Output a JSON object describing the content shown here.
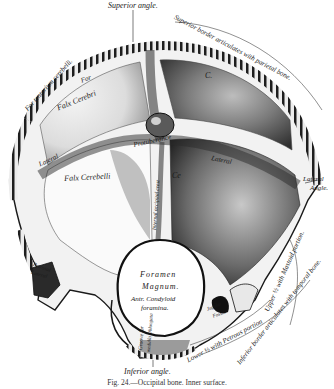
{
  "figure": {
    "caption": "Fig. 24.—Occipital bone. Inner surface.",
    "colors": {
      "ink": "#1a1a1a",
      "shade": "#4a4a4a",
      "mid": "#8a8a8a",
      "light": "#cfcfcf",
      "paper": "#ffffff"
    }
  },
  "labels": {
    "superior_angle": "Superior angle.",
    "superior_border": "Superior border articulates with parietal bone.",
    "for_tentorium": "For tentorium cerebelli.",
    "for": "For",
    "falx_cerebri": "Falx Cerebri",
    "c_upper": "C.",
    "c_left": "C.",
    "lateral_sinus_left": "Lateral",
    "lateral_sinus_right": "Lateral",
    "protuberance": "Protuberance",
    "falx_cerebelli": "Falx Cerebelli",
    "crest": "Internal occipital crest",
    "ce_right": "Ce",
    "lateral_angle_1": "Lateral",
    "lateral_angle_2": "Angle.",
    "foramen": "Foramen",
    "magnum": "Magnum.",
    "antr_condyloid": "Antr. Condyloid",
    "foramina": "foramina.",
    "petrosal": "Petrosal",
    "lateral_lower": "Lateral",
    "groove": "Groove for",
    "medulla": "medulla Oblongata",
    "upper_mastoid": "Upper ½ with Mastoid portion.",
    "jugular": "Jugular",
    "fossa": "Fossa.",
    "lower_petrous": "Lower ½ with Petrous portion",
    "inferior_border": "Inferior border articulates with temporal bone.",
    "inferior_angle": "Inferior angle."
  }
}
